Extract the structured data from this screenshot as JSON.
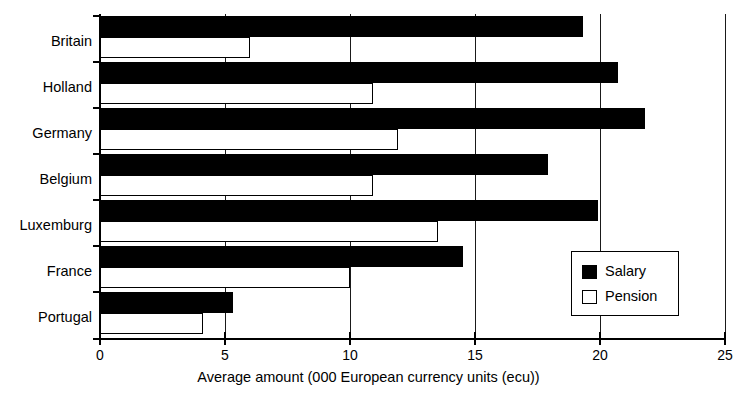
{
  "chart_data": {
    "type": "bar",
    "orientation": "horizontal",
    "title": "",
    "xlabel": "Average amount (000 European currency units (ecu))",
    "ylabel": "",
    "xlim": [
      0,
      25
    ],
    "xticks": [
      0,
      5,
      10,
      15,
      20,
      25
    ],
    "xtick_labels": [
      "0",
      "5",
      "10",
      "15",
      "20",
      "25"
    ],
    "grid": true,
    "grid_axis": "x",
    "legend_position": "center right",
    "categories": [
      "Britain",
      "Holland",
      "Germany",
      "Belgium",
      "Luxemburg",
      "France",
      "Portugal"
    ],
    "series": [
      {
        "name": "Salary",
        "color": "#000000",
        "values": [
          19.3,
          20.7,
          21.8,
          17.9,
          19.9,
          14.5,
          5.3
        ]
      },
      {
        "name": "Pension",
        "color": "#ffffff",
        "values": [
          6.0,
          10.9,
          11.9,
          10.9,
          13.5,
          10.0,
          4.1
        ]
      }
    ]
  },
  "legend": {
    "items": [
      {
        "label": "Salary",
        "swatch": "filled-black-square"
      },
      {
        "label": "Pension",
        "swatch": "open-white-square"
      }
    ]
  }
}
